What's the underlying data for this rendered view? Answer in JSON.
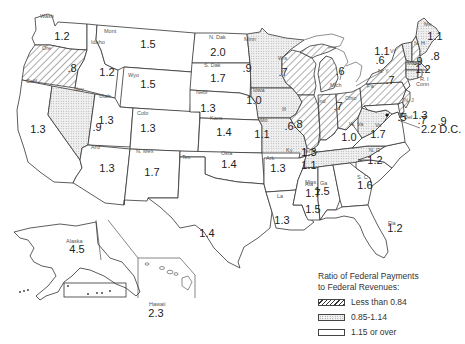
{
  "map": {
    "title": "Ratio of Federal Payments to Federal Revenues by State",
    "states": [
      {
        "abbr": "Wash",
        "value": "1.2",
        "category": "high"
      },
      {
        "abbr": "Ore",
        "value": ".8",
        "category": "low"
      },
      {
        "abbr": "Calif",
        "value": "1.3",
        "category": "high"
      },
      {
        "abbr": "Nev",
        "value": ".9",
        "category": "mid"
      },
      {
        "abbr": "Idaho",
        "value": "1.2",
        "category": "high"
      },
      {
        "abbr": "Mont",
        "value": "1.5",
        "category": "high"
      },
      {
        "abbr": "Wyo",
        "value": "1.5",
        "category": "high"
      },
      {
        "abbr": "Utah",
        "value": "1.3",
        "category": "high"
      },
      {
        "abbr": "Colo",
        "value": "1.3",
        "category": "high"
      },
      {
        "abbr": "Ariz",
        "value": "1.3",
        "category": "high"
      },
      {
        "abbr": "N. Mex",
        "value": "1.7",
        "category": "high"
      },
      {
        "abbr": "N. Dak",
        "value": "2.0",
        "category": "high"
      },
      {
        "abbr": "S. Dak",
        "value": "1.7",
        "category": "high"
      },
      {
        "abbr": "Nebr",
        "value": "1.3",
        "category": "high"
      },
      {
        "abbr": "Kans",
        "value": "1.4",
        "category": "high"
      },
      {
        "abbr": "Okla",
        "value": "1.4",
        "category": "high"
      },
      {
        "abbr": "Tex",
        "value": "1.4",
        "category": "high"
      },
      {
        "abbr": "Minn",
        "value": ".9",
        "category": "mid"
      },
      {
        "abbr": "Iowa",
        "value": "1.0",
        "category": "mid"
      },
      {
        "abbr": "Mo",
        "value": "1.1",
        "category": "mid"
      },
      {
        "abbr": "Ark",
        "value": "1.3",
        "category": "high"
      },
      {
        "abbr": "La",
        "value": "1.3",
        "category": "high"
      },
      {
        "abbr": "Wis",
        "value": ".7",
        "category": "low"
      },
      {
        "abbr": "Ill",
        "value": ".6",
        "category": "low"
      },
      {
        "abbr": "Mich",
        "value": ".6",
        "category": "low"
      },
      {
        "abbr": "Ind",
        "value": ".8",
        "category": "low"
      },
      {
        "abbr": "Ohio",
        "value": ".7",
        "category": "low"
      },
      {
        "abbr": "Ky",
        "value": "1.3",
        "category": "high"
      },
      {
        "abbr": "Tenn",
        "value": "1.1",
        "category": "mid"
      },
      {
        "abbr": "Miss",
        "value": "1.7",
        "category": "high"
      },
      {
        "abbr": "Ala",
        "value": "1.5",
        "category": "high"
      },
      {
        "abbr": "Ga",
        "value": "1.5",
        "category": "high"
      },
      {
        "abbr": "Fla",
        "value": "1.2",
        "category": "high"
      },
      {
        "abbr": "S. C",
        "value": "1.6",
        "category": "high"
      },
      {
        "abbr": "N. C",
        "value": "1.2",
        "category": "high"
      },
      {
        "abbr": "Va",
        "value": "1.7",
        "category": "high"
      },
      {
        "abbr": "W. Va",
        "value": "1.0",
        "category": "mid"
      },
      {
        "abbr": "Pa",
        "value": ".7",
        "category": "low"
      },
      {
        "abbr": "N. Y",
        "value": ".6",
        "category": "low"
      },
      {
        "abbr": "Md",
        "value": "1.3",
        "category": "high"
      },
      {
        "abbr": "Del",
        "value": ".5",
        "category": "low"
      },
      {
        "abbr": "N. J",
        "value": ".7",
        "category": "low"
      },
      {
        "abbr": "Conn",
        "value": ".9",
        "category": "mid"
      },
      {
        "abbr": "R. I",
        "value": "1.2",
        "category": "high"
      },
      {
        "abbr": "Mass",
        "value": ".9",
        "category": "mid"
      },
      {
        "abbr": "Vt",
        "value": "1.1",
        "category": "mid"
      },
      {
        "abbr": "N. H",
        "value": ".8",
        "category": "low"
      },
      {
        "abbr": "Me",
        "value": "1.1",
        "category": "mid"
      },
      {
        "abbr": "Alaska",
        "value": "4.5",
        "category": "high"
      },
      {
        "abbr": "Hawaii",
        "value": "2.3",
        "category": "high"
      }
    ],
    "dc": {
      "label": "D.C.",
      "value": "2.2"
    }
  },
  "legend": {
    "title_line1": "Ratio of Federal Payments",
    "title_line2": "to Federal Revenues:",
    "items": [
      {
        "label": "Less than 0.84",
        "category": "low"
      },
      {
        "label": "0.85-1.14",
        "category": "mid"
      },
      {
        "label": "1.15 or over",
        "category": "high"
      }
    ]
  }
}
